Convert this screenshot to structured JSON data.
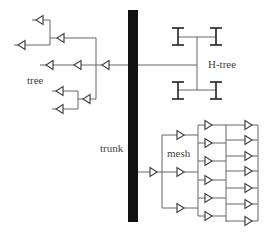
{
  "labels": {
    "tree": "tree",
    "htree": "H-tree",
    "trunk": "trunk",
    "mesh": "mesh"
  },
  "colors": {
    "trunk": "#111111",
    "wire": "#666666",
    "buffer": "#444444",
    "background": "#ffffff"
  },
  "structure": {
    "trunk": {
      "x": 128,
      "y": 10,
      "width": 10,
      "height": 212
    },
    "tree_buffers": 10,
    "htree_leaves": 4,
    "mesh_buffers_stage1": 1,
    "mesh_buffers_stage2": 3,
    "mesh_buffers_stage3": 6,
    "mesh_buffers_stage4": 7
  }
}
